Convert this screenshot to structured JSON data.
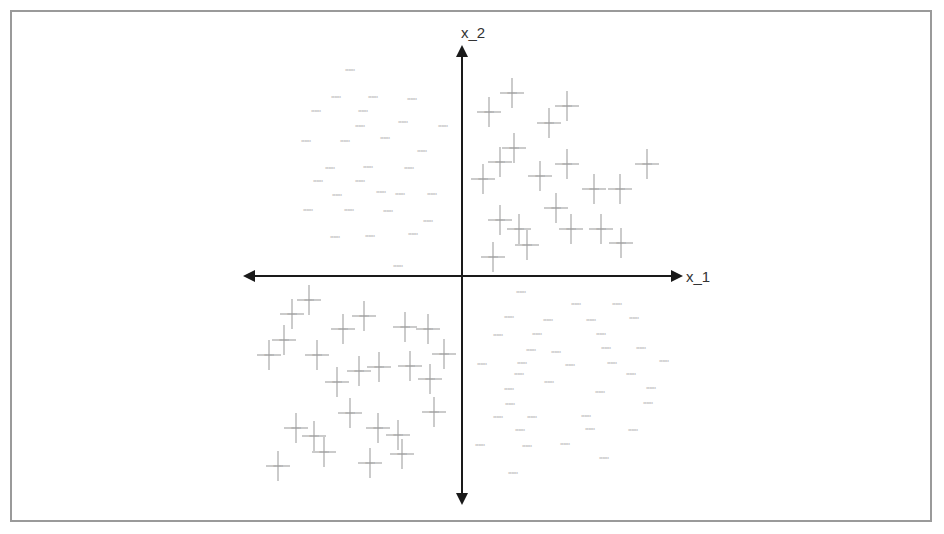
{
  "chart_data": {
    "type": "scatter",
    "title": "",
    "xlabel": "x_1",
    "ylabel": "x_2",
    "grid": false,
    "legend": null,
    "axes": {
      "origin_px": [
        462,
        276
      ],
      "x_axis_px": [
        243,
        683
      ],
      "y_axis_px": [
        45,
        505
      ],
      "arrows": "both-ends"
    },
    "colors": {
      "axis": "#1a1a1a",
      "marker": "#a8a8a8",
      "label": "#9a9a9a",
      "frame": "#9a9a9a"
    },
    "series": [
      {
        "name": "quadrant-II (text labels only)",
        "marker": "none",
        "label_legible": false,
        "points_px": [
          [
            350,
            70
          ],
          [
            336,
            97
          ],
          [
            373,
            97
          ],
          [
            412,
            99
          ],
          [
            316,
            111
          ],
          [
            363,
            111
          ],
          [
            403,
            122
          ],
          [
            360,
            126
          ],
          [
            443,
            126
          ],
          [
            306,
            141
          ],
          [
            345,
            141
          ],
          [
            385,
            138
          ],
          [
            422,
            151
          ],
          [
            330,
            168
          ],
          [
            368,
            167
          ],
          [
            409,
            168
          ],
          [
            318,
            181
          ],
          [
            360,
            181
          ],
          [
            400,
            194
          ],
          [
            337,
            195
          ],
          [
            381,
            192
          ],
          [
            432,
            194
          ],
          [
            308,
            210
          ],
          [
            349,
            210
          ],
          [
            388,
            211
          ],
          [
            428,
            221
          ],
          [
            335,
            237
          ],
          [
            370,
            236
          ],
          [
            413,
            234
          ],
          [
            398,
            266
          ]
        ]
      },
      {
        "name": "quadrant-I (cross markers)",
        "marker": "cross",
        "label_legible": false,
        "points_px": [
          [
            512,
            93
          ],
          [
            489,
            112
          ],
          [
            567,
            106
          ],
          [
            549,
            123
          ],
          [
            514,
            148
          ],
          [
            500,
            162
          ],
          [
            567,
            164
          ],
          [
            483,
            179
          ],
          [
            540,
            176
          ],
          [
            647,
            164
          ],
          [
            594,
            189
          ],
          [
            620,
            189
          ],
          [
            556,
            208
          ],
          [
            500,
            220
          ],
          [
            519,
            229
          ],
          [
            571,
            229
          ],
          [
            601,
            229
          ],
          [
            527,
            245
          ],
          [
            621,
            243
          ],
          [
            493,
            257
          ]
        ]
      },
      {
        "name": "quadrant-III (cross markers)",
        "marker": "cross",
        "label_legible": false,
        "points_px": [
          [
            309,
            300
          ],
          [
            292,
            314
          ],
          [
            364,
            316
          ],
          [
            343,
            329
          ],
          [
            405,
            327
          ],
          [
            428,
            329
          ],
          [
            284,
            340
          ],
          [
            269,
            355
          ],
          [
            317,
            355
          ],
          [
            444,
            354
          ],
          [
            379,
            367
          ],
          [
            359,
            371
          ],
          [
            410,
            366
          ],
          [
            430,
            379
          ],
          [
            337,
            382
          ],
          [
            350,
            413
          ],
          [
            434,
            412
          ],
          [
            296,
            428
          ],
          [
            378,
            428
          ],
          [
            314,
            436
          ],
          [
            398,
            435
          ],
          [
            324,
            452
          ],
          [
            278,
            466
          ],
          [
            370,
            463
          ],
          [
            402,
            454
          ]
        ]
      },
      {
        "name": "quadrant-IV (text labels only)",
        "marker": "none",
        "label_legible": false,
        "points_px": [
          [
            521,
            292
          ],
          [
            576,
            304
          ],
          [
            617,
            304
          ],
          [
            509,
            317
          ],
          [
            548,
            320
          ],
          [
            591,
            320
          ],
          [
            634,
            318
          ],
          [
            498,
            335
          ],
          [
            537,
            334
          ],
          [
            601,
            334
          ],
          [
            531,
            350
          ],
          [
            556,
            352
          ],
          [
            606,
            348
          ],
          [
            641,
            348
          ],
          [
            482,
            364
          ],
          [
            522,
            363
          ],
          [
            570,
            365
          ],
          [
            612,
            363
          ],
          [
            664,
            361
          ],
          [
            519,
            374
          ],
          [
            631,
            374
          ],
          [
            549,
            382
          ],
          [
            509,
            389
          ],
          [
            600,
            392
          ],
          [
            651,
            388
          ],
          [
            510,
            404
          ],
          [
            648,
            403
          ],
          [
            498,
            417
          ],
          [
            532,
            417
          ],
          [
            586,
            416
          ],
          [
            520,
            430
          ],
          [
            590,
            429
          ],
          [
            633,
            430
          ],
          [
            480,
            445
          ],
          [
            527,
            446
          ],
          [
            565,
            444
          ],
          [
            604,
            458
          ],
          [
            513,
            473
          ]
        ]
      }
    ],
    "point_label_placeholder": "xxxxxx"
  }
}
